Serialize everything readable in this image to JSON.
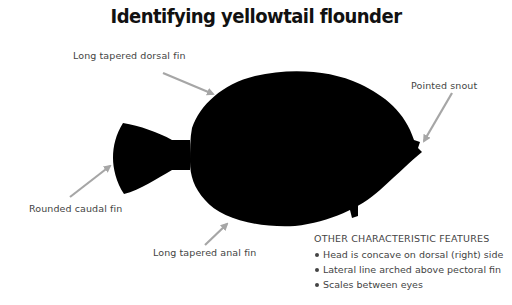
{
  "title": "Identifying yellowtail flounder",
  "labels": {
    "dorsal_fin": "Long tapered dorsal fin",
    "snout": "Pointed snout",
    "caudal_fin": "Rounded caudal fin",
    "anal_fin": "Long tapered anal fin"
  },
  "features": {
    "heading": "OTHER CHARACTERISTIC FEATURES",
    "items": [
      "Head is concave on dorsal (right) side",
      "Lateral line arched above pectoral fin",
      "Scales between eyes"
    ]
  },
  "colors": {
    "silhouette": "#000000",
    "arrow": "#a6a6a6",
    "label_text": "#444444",
    "background": "#ffffff"
  }
}
